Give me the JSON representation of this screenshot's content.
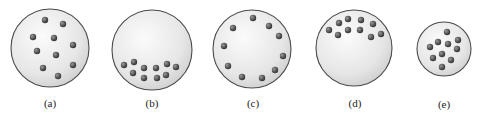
{
  "figure": {
    "panels": [
      {
        "label": "(a)",
        "circle": {
          "cx": 50,
          "cy": 48,
          "r": 39
        },
        "label_pos": {
          "x": 50,
          "y": 107
        },
        "particles": [
          [
            45,
            20
          ],
          [
            63,
            24
          ],
          [
            33,
            37
          ],
          [
            54,
            38
          ],
          [
            73,
            45
          ],
          [
            37,
            51
          ],
          [
            56,
            55
          ],
          [
            43,
            68
          ],
          [
            73,
            65
          ],
          [
            58,
            76
          ]
        ]
      },
      {
        "label": "(b)",
        "circle": {
          "cx": 152,
          "cy": 50,
          "r": 40
        },
        "label_pos": {
          "x": 152,
          "y": 107
        },
        "particles": [
          [
            124,
            65
          ],
          [
            134,
            62
          ],
          [
            144,
            68
          ],
          [
            156,
            68
          ],
          [
            167,
            64
          ],
          [
            176,
            67
          ],
          [
            133,
            73
          ],
          [
            144,
            78
          ],
          [
            157,
            78
          ],
          [
            166,
            75
          ]
        ]
      },
      {
        "label": "(c)",
        "circle": {
          "cx": 252,
          "cy": 49,
          "r": 39
        },
        "label_pos": {
          "x": 253,
          "y": 107
        },
        "particles": [
          [
            253,
            18
          ],
          [
            233,
            28
          ],
          [
            269,
            26
          ],
          [
            279,
            36
          ],
          [
            224,
            46
          ],
          [
            283,
            56
          ],
          [
            228,
            66
          ],
          [
            275,
            70
          ],
          [
            242,
            77
          ],
          [
            262,
            78
          ]
        ]
      },
      {
        "label": "(d)",
        "circle": {
          "cx": 354,
          "cy": 48,
          "r": 38
        },
        "label_pos": {
          "x": 355,
          "y": 107
        },
        "particles": [
          [
            339,
            23
          ],
          [
            348,
            19
          ],
          [
            361,
            20
          ],
          [
            373,
            24
          ],
          [
            329,
            30
          ],
          [
            338,
            35
          ],
          [
            348,
            30
          ],
          [
            360,
            30
          ],
          [
            371,
            37
          ],
          [
            381,
            34
          ]
        ]
      },
      {
        "label": "(e)",
        "circle": {
          "cx": 444,
          "cy": 49,
          "r": 27
        },
        "label_pos": {
          "x": 444,
          "y": 108
        },
        "particles": [
          [
            447,
            32
          ],
          [
            438,
            42
          ],
          [
            448,
            44
          ],
          [
            458,
            40
          ],
          [
            430,
            47
          ],
          [
            457,
            49
          ],
          [
            442,
            54
          ],
          [
            433,
            58
          ],
          [
            451,
            60
          ],
          [
            442,
            67
          ]
        ]
      }
    ],
    "colors": {
      "circle_stroke": "#4a4a4a",
      "circle_fill_light": "#fbfbfb",
      "circle_fill_dark": "#d4d4d4",
      "particle_light": "#8a8a8a",
      "particle_dark": "#3a3a3a"
    },
    "particle_radius": 3.2
  }
}
